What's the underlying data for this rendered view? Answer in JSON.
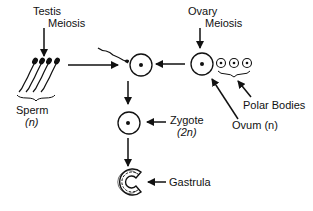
{
  "labels": {
    "testis": "Testis",
    "testis_meiosis": "Meiosis",
    "sperm": "Sperm",
    "sperm_ploidy": "(n)",
    "ovary": "Ovary",
    "ovary_meiosis": "Meiosis",
    "polar_bodies": "Polar Bodies",
    "ovum": "Ovum (n)",
    "zygote": "Zygote",
    "zygote_ploidy": "(2n)",
    "gastrula": "Gastrula"
  },
  "colors": {
    "ink": "#111111",
    "background": "#ffffff"
  }
}
